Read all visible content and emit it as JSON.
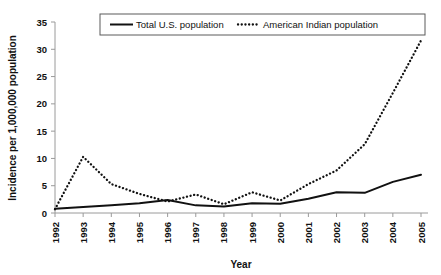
{
  "chart_data": {
    "type": "line",
    "title": "",
    "xlabel": "Year",
    "ylabel": "Incidence per 1,000,000 population",
    "categories": [
      "1992",
      "1993",
      "1994",
      "1995",
      "1996",
      "1997",
      "1998",
      "1999",
      "2000",
      "2001",
      "2002",
      "2003",
      "2004",
      "2005"
    ],
    "x": [
      1992,
      1993,
      1994,
      1995,
      1996,
      1997,
      1998,
      1999,
      2000,
      2001,
      2002,
      2003,
      2004,
      2005
    ],
    "xtick_labels": [
      "1992",
      "1993",
      "1994",
      "1995",
      "1996",
      "1997",
      "1998",
      "1999",
      "2000",
      "2001",
      "2002",
      "2003",
      "2004",
      "2005"
    ],
    "ytick_labels": [
      "0",
      "5",
      "10",
      "15",
      "20",
      "25",
      "30",
      "35"
    ],
    "ytick_values": [
      0,
      5,
      10,
      15,
      20,
      25,
      30,
      35
    ],
    "ylim": [
      0,
      35
    ],
    "xlim": [
      1992,
      2005
    ],
    "grid": false,
    "legend_position": "top-center",
    "series": [
      {
        "name": "Total U.S. population",
        "style": "solid",
        "color": "#111111",
        "values": [
          0.8,
          1.1,
          1.4,
          1.8,
          2.4,
          1.4,
          1.2,
          1.8,
          1.7,
          2.6,
          3.8,
          3.7,
          5.7,
          7.0
        ]
      },
      {
        "name": "American Indian population",
        "style": "dotted",
        "color": "#111111",
        "values": [
          0.7,
          10.3,
          5.3,
          3.5,
          2.1,
          3.4,
          1.6,
          3.8,
          2.3,
          5.3,
          7.8,
          12.6,
          22.0,
          31.6
        ]
      }
    ]
  },
  "legend": {
    "entries": [
      {
        "label": "Total U.S. population",
        "style": "solid"
      },
      {
        "label": "American Indian population",
        "style": "dotted"
      }
    ]
  },
  "axes": {
    "y_axis_label": "Incidence per 1,000,000 population",
    "x_axis_label": "Year"
  }
}
